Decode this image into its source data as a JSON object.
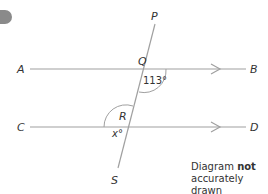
{
  "question_marker": {
    "icon": "question-number-pill",
    "color": "#8a8a8a"
  },
  "diagram": {
    "points": {
      "A": "A",
      "B": "B",
      "C": "C",
      "D": "D",
      "P": "P",
      "Q": "Q",
      "R": "R",
      "S": "S"
    },
    "angles": {
      "at_Q": "113°",
      "at_R": "x°"
    },
    "parallel_marks": "single arrowheads on AB and CD",
    "line_color": "#9a9a9a",
    "note": {
      "prefix": "Diagram",
      "bold": "not",
      "suffix": "accurately drawn"
    }
  }
}
